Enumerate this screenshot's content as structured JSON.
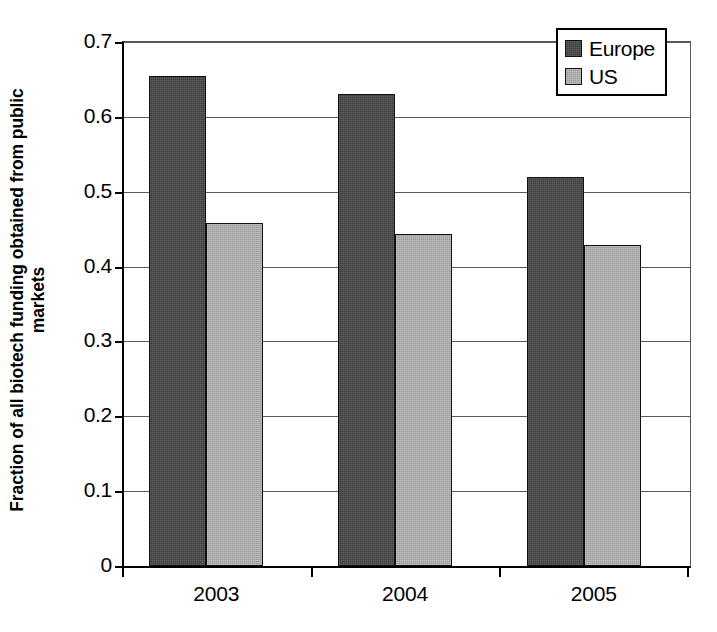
{
  "chart_data": {
    "type": "bar",
    "title": "",
    "xlabel": "",
    "ylabel_lines": [
      "Fraction of all biotech funding obtained from public",
      "markets"
    ],
    "ylabel": "Fraction of all biotech funding obtained from public markets",
    "categories": [
      "2003",
      "2004",
      "2005"
    ],
    "series": [
      {
        "name": "Europe",
        "color": "#3b3b3b",
        "values": [
          0.655,
          0.631,
          0.52
        ]
      },
      {
        "name": "US",
        "color": "#9b9b9b",
        "values": [
          0.458,
          0.443,
          0.429
        ]
      }
    ],
    "ylim": [
      0,
      0.7
    ],
    "yticks": [
      0,
      0.1,
      0.2,
      0.3,
      0.4,
      0.5,
      0.6,
      0.7
    ],
    "ytick_labels": [
      "0",
      "0.1",
      "0.2",
      "0.3",
      "0.4",
      "0.5",
      "0.6",
      "0.7"
    ],
    "grid": true,
    "grid_axis": "y",
    "legend_position": "top-right",
    "legend": [
      "Europe",
      "US"
    ]
  }
}
